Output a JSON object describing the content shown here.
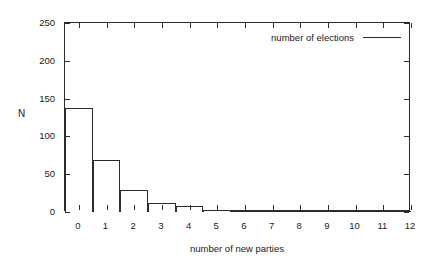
{
  "chart_data": {
    "type": "bar",
    "title": "",
    "xlabel": "number of new parties",
    "ylabel": "N",
    "categories": [
      0,
      1,
      2,
      3,
      4,
      5,
      6,
      7,
      8,
      9,
      10,
      11,
      12
    ],
    "values": [
      137,
      69,
      29,
      12,
      8,
      3,
      0,
      1,
      0,
      1,
      0,
      0,
      0
    ],
    "series": [
      {
        "name": "number of elections",
        "values": [
          137,
          69,
          29,
          12,
          8,
          3,
          0,
          1,
          0,
          1,
          0,
          0,
          0
        ]
      }
    ],
    "xlim": [
      -0.5,
      12.0
    ],
    "ylim": [
      0,
      250
    ],
    "ytick_labels": [
      "0",
      "50",
      "100",
      "150",
      "200",
      "250"
    ],
    "ytick_values": [
      0,
      50,
      100,
      150,
      200,
      250
    ],
    "xtick_labels": [
      "0",
      "1",
      "2",
      "3",
      "4",
      "5",
      "6",
      "7",
      "8",
      "9",
      "10",
      "11",
      "12"
    ],
    "xtick_values": [
      0,
      1,
      2,
      3,
      4,
      5,
      6,
      7,
      8,
      9,
      10,
      11,
      12
    ],
    "grid": false,
    "legend_position": "top-right",
    "bar_fill": "#ffffff",
    "bar_edge": "#2b2b2b",
    "frame_color": "#2b2b2b",
    "background": "#ffffff"
  },
  "legend": {
    "entries": [
      {
        "label": "number of elections",
        "marker": "line",
        "color": "#2b2b2b"
      }
    ]
  },
  "axes": {
    "y_title": "N",
    "x_title": "number of new parties"
  }
}
